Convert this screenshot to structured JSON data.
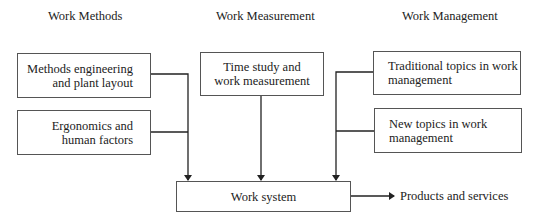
{
  "headers": {
    "methods": "Work Methods",
    "measurement": "Work Measurement",
    "management": "Work Management"
  },
  "boxes": {
    "methods_engineering": {
      "line1": "Methods engineering",
      "line2": "and plant layout"
    },
    "ergonomics": {
      "line1": "Ergonomics and",
      "line2": "human factors"
    },
    "time_study": {
      "line1": "Time study and",
      "line2": "work measurement"
    },
    "traditional_topics": {
      "line1": "Traditional topics in work",
      "line2": "management"
    },
    "new_topics": {
      "line1": "New topics in work",
      "line2": "management"
    },
    "work_system": {
      "label": "Work system"
    }
  },
  "output": {
    "label": "Products and services"
  }
}
